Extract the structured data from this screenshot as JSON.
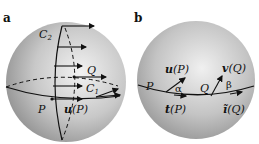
{
  "figure": {
    "panel_a": {
      "label": "a",
      "labels": {
        "c2": "C",
        "c2_sub": "2",
        "q": "Q",
        "c1": "C",
        "c1_sub": "1",
        "p": "P",
        "u_bold": "u",
        "u_arg": "(P)"
      }
    },
    "panel_b": {
      "label": "b",
      "labels": {
        "u_bold": "u",
        "u_arg": "(P)",
        "v_bold": "v",
        "v_arg": "(Q)",
        "p": "P",
        "alpha": "α",
        "q": "Q",
        "beta": "β",
        "t_bold": "t",
        "t_arg": "(P)",
        "t_tilde_bold": "ĩ",
        "t_tilde_arg": "(Q)"
      }
    },
    "colors": {
      "sphere_light": "#e4e4e4",
      "sphere_dark": "#8a8a8a",
      "line": "#111111"
    }
  }
}
